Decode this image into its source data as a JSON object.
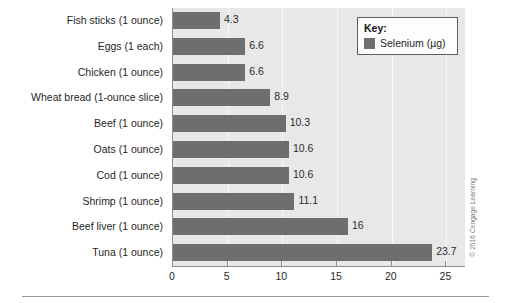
{
  "chart_data": {
    "type": "bar",
    "orientation": "horizontal",
    "title": "",
    "xlabel": "",
    "ylabel": "",
    "xlim": [
      0,
      26.7
    ],
    "grid": true,
    "legend_position": "top-right",
    "categories": [
      "Fish sticks (1 ounce)",
      "Eggs (1 each)",
      "Chicken (1 ounce)",
      "Wheat bread (1-ounce slice)",
      "Beef (1 ounce)",
      "Oats (1 ounce)",
      "Cod (1 ounce)",
      "Shrimp (1 ounce)",
      "Beef liver (1 ounce)",
      "Tuna (1 ounce)"
    ],
    "values": [
      4.3,
      6.6,
      6.6,
      8.9,
      10.3,
      10.6,
      10.6,
      11.1,
      16,
      23.7
    ],
    "value_labels": [
      "4.3",
      "6.6",
      "6.6",
      "8.9",
      "10.3",
      "10.6",
      "10.6",
      "11.1",
      "16",
      "23.7"
    ],
    "series": [
      {
        "name": "Selenium (µg)",
        "values": [
          4.3,
          6.6,
          6.6,
          8.9,
          10.3,
          10.6,
          10.6,
          11.1,
          16,
          23.7
        ]
      }
    ],
    "xticks": [
      0,
      5,
      10,
      15,
      20,
      25
    ],
    "xtick_labels": [
      "0",
      "5",
      "10",
      "15",
      "20",
      "25"
    ],
    "colors": {
      "bar": "#6e6e6e",
      "plot_background": "#e8e8e8",
      "page_background": "#ffffff",
      "axis": "#8d8d8d",
      "gridline": "#f7f7f7",
      "text": "#1f1f1f"
    }
  },
  "legend": {
    "title": "Key:",
    "entries": [
      {
        "label": "Selenium (µg)",
        "color": "#6e6e6e"
      }
    ]
  },
  "credit": {
    "text": "© 2016 Cengage Learning"
  }
}
